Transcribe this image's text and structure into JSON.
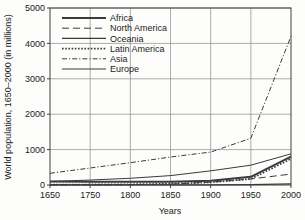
{
  "chart_data": {
    "type": "line",
    "title": "",
    "xlabel": "Years",
    "ylabel": "World population, 1650–2000 (in millions)",
    "x": [
      1650,
      1750,
      1800,
      1850,
      1900,
      1950,
      2000
    ],
    "xtick_labels": [
      "1650",
      "1750",
      "1800",
      "1850",
      "1900",
      "1950",
      "2000"
    ],
    "ytick_labels": [
      "0",
      "1000",
      "2000",
      "3000",
      "4000",
      "5000"
    ],
    "yticks": [
      0,
      1000,
      2000,
      3000,
      4000,
      5000
    ],
    "ylim": [
      0,
      5000
    ],
    "grid": true,
    "legend_position": "upper-left",
    "axis_scale_note": "x axis spacing is uniform between listed tick labels",
    "series": [
      {
        "name": "Africa",
        "style": "solid-thick",
        "values": [
          100,
          95,
          90,
          95,
          120,
          230,
          800
        ]
      },
      {
        "name": "North America",
        "style": "long-dash",
        "values": [
          5,
          5,
          10,
          25,
          80,
          170,
          310
        ]
      },
      {
        "name": "Oceania",
        "style": "solid",
        "values": [
          2,
          2,
          2,
          2,
          6,
          13,
          30
        ]
      },
      {
        "name": "Latin America",
        "style": "dotted",
        "values": [
          12,
          15,
          20,
          35,
          75,
          170,
          740
        ]
      },
      {
        "name": "Asia",
        "style": "dash-dot",
        "values": [
          330,
          480,
          630,
          790,
          930,
          1320,
          4200
        ]
      },
      {
        "name": "Europe",
        "style": "thin-solid",
        "values": [
          100,
          140,
          190,
          265,
          400,
          560,
          880
        ]
      }
    ]
  },
  "legend": {
    "entries": [
      {
        "label": "Africa"
      },
      {
        "label": "North America"
      },
      {
        "label": "Oceania"
      },
      {
        "label": "Latin America"
      },
      {
        "label": "Asia"
      },
      {
        "label": "Europe"
      }
    ]
  },
  "colors": {
    "axis": "#404040",
    "grid": "#8a8a8a",
    "series": "#3a3a3a",
    "background": "#fdfdfc"
  }
}
